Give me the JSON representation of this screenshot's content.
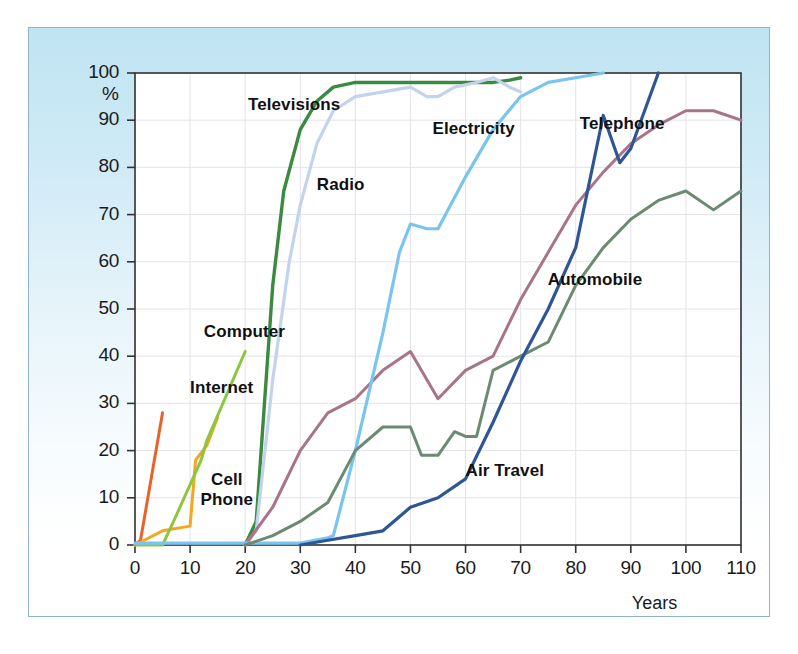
{
  "figure": {
    "background_top_color": "#bfe4f2",
    "background_bottom_color": "#ffffff",
    "border_color": "#8fb3cf",
    "plot_background": "#ffffff",
    "plot_border_color": "#333333",
    "grid_color": "#e3e3ea"
  },
  "chart_data": {
    "type": "line",
    "title": "",
    "subtitle": "",
    "xlabel": "Years",
    "ylabel": "%",
    "xlim": [
      0,
      110
    ],
    "ylim": [
      0,
      100
    ],
    "xticks": [
      0,
      10,
      20,
      30,
      40,
      50,
      60,
      70,
      80,
      90,
      100,
      110
    ],
    "xticklabels": [
      "0",
      "10",
      "20",
      "30",
      "40",
      "50",
      "60",
      "70",
      "80",
      "90",
      "100",
      "110"
    ],
    "yticks": [
      0,
      10,
      20,
      30,
      40,
      50,
      60,
      70,
      80,
      90,
      100
    ],
    "yticklabels": [
      "0",
      "10",
      "20",
      "30",
      "40",
      "50",
      "60",
      "70",
      "80",
      "90",
      "100"
    ],
    "y_unit_label": "%",
    "grid": true,
    "legend": "inline-labels",
    "series": [
      {
        "name": "Internet",
        "color": "#e8622a",
        "width": 3.0,
        "label_x": 10.0,
        "label_y": 33.0,
        "points": [
          [
            0,
            0
          ],
          [
            1,
            1
          ],
          [
            5,
            28
          ]
        ]
      },
      {
        "name": "Cell Phone",
        "color": "#f5a623",
        "width": 3.0,
        "label_x": 10.5,
        "label_y": 13.5,
        "points": [
          [
            0,
            0
          ],
          [
            5,
            3
          ],
          [
            10,
            4
          ],
          [
            11,
            18
          ],
          [
            13,
            21
          ],
          [
            15,
            27
          ]
        ]
      },
      {
        "name": "Computer",
        "color": "#8cc63e",
        "width": 3.0,
        "label_x": 12.5,
        "label_y": 45.0,
        "points": [
          [
            0,
            0
          ],
          [
            5,
            0
          ],
          [
            7,
            5
          ],
          [
            12,
            18
          ],
          [
            13,
            22
          ],
          [
            20,
            41
          ]
        ]
      },
      {
        "name": "Televisions",
        "color": "#3a8a40",
        "width": 3.4,
        "label_x": 20.5,
        "label_y": 93.0,
        "points": [
          [
            20,
            0
          ],
          [
            22,
            5
          ],
          [
            25,
            55
          ],
          [
            27,
            75
          ],
          [
            30,
            88
          ],
          [
            33,
            94
          ],
          [
            36,
            97
          ],
          [
            40,
            98
          ],
          [
            50,
            98
          ],
          [
            55,
            98
          ],
          [
            60,
            98
          ],
          [
            65,
            98
          ],
          [
            68,
            98.5
          ],
          [
            70,
            99
          ]
        ]
      },
      {
        "name": "Radio",
        "color": "#c3d3ec",
        "width": 3.2,
        "label_x": 33.0,
        "label_y": 76.0,
        "points": [
          [
            20,
            0
          ],
          [
            22,
            3
          ],
          [
            25,
            35
          ],
          [
            28,
            60
          ],
          [
            30,
            72
          ],
          [
            33,
            85
          ],
          [
            36,
            92
          ],
          [
            40,
            95
          ],
          [
            45,
            96
          ],
          [
            50,
            97
          ],
          [
            53,
            95
          ],
          [
            55,
            95
          ],
          [
            58,
            97
          ],
          [
            62,
            98
          ],
          [
            65,
            99
          ],
          [
            68,
            97
          ],
          [
            70,
            96
          ]
        ]
      },
      {
        "name": "Telephone",
        "color": "#a9738a",
        "width": 3.0,
        "label_x": 92.0,
        "label_y": 89.0,
        "points": [
          [
            20,
            0
          ],
          [
            25,
            8
          ],
          [
            30,
            20
          ],
          [
            35,
            28
          ],
          [
            40,
            31
          ],
          [
            45,
            37
          ],
          [
            50,
            41
          ],
          [
            55,
            31
          ],
          [
            60,
            37
          ],
          [
            65,
            40
          ],
          [
            70,
            52
          ],
          [
            75,
            62
          ],
          [
            80,
            72
          ],
          [
            85,
            79
          ],
          [
            90,
            85
          ],
          [
            95,
            89
          ],
          [
            100,
            92
          ],
          [
            105,
            92
          ],
          [
            110,
            90
          ]
        ]
      },
      {
        "name": "Electricity",
        "color": "#7ac5ef",
        "width": 3.2,
        "label_x": 54.0,
        "label_y": 88.0,
        "points": [
          [
            0,
            0.4
          ],
          [
            10,
            0.4
          ],
          [
            20,
            0.4
          ],
          [
            30,
            0.4
          ],
          [
            35,
            1.5
          ],
          [
            36,
            2
          ],
          [
            40,
            20
          ],
          [
            45,
            45
          ],
          [
            48,
            62
          ],
          [
            50,
            68
          ],
          [
            53,
            67
          ],
          [
            55,
            67
          ],
          [
            60,
            78
          ],
          [
            65,
            88
          ],
          [
            70,
            95
          ],
          [
            75,
            98
          ],
          [
            80,
            99
          ],
          [
            85,
            100
          ]
        ]
      },
      {
        "name": "Automobile",
        "color": "#6b8a72",
        "width": 3.0,
        "label_x": 84.0,
        "label_y": 56.0,
        "points": [
          [
            20,
            0
          ],
          [
            25,
            2
          ],
          [
            30,
            5
          ],
          [
            35,
            9
          ],
          [
            40,
            20
          ],
          [
            45,
            25
          ],
          [
            48,
            25
          ],
          [
            50,
            25
          ],
          [
            52,
            19
          ],
          [
            55,
            19
          ],
          [
            58,
            24
          ],
          [
            60,
            23
          ],
          [
            62,
            23
          ],
          [
            65,
            37
          ],
          [
            70,
            40
          ],
          [
            75,
            43
          ],
          [
            80,
            55
          ],
          [
            85,
            63
          ],
          [
            90,
            69
          ],
          [
            95,
            73
          ],
          [
            100,
            75
          ],
          [
            105,
            71
          ],
          [
            110,
            75
          ]
        ]
      },
      {
        "name": "Air Travel",
        "color": "#2f5694",
        "width": 3.2,
        "label_x": 60.0,
        "label_y": 15.5,
        "points": [
          [
            30,
            0
          ],
          [
            35,
            1
          ],
          [
            40,
            2
          ],
          [
            45,
            3
          ],
          [
            50,
            8
          ],
          [
            55,
            10
          ],
          [
            60,
            14
          ],
          [
            65,
            26
          ],
          [
            70,
            39
          ],
          [
            75,
            50
          ],
          [
            80,
            63
          ],
          [
            85,
            91
          ],
          [
            88,
            81
          ],
          [
            90,
            84
          ],
          [
            95,
            100
          ]
        ]
      }
    ]
  }
}
